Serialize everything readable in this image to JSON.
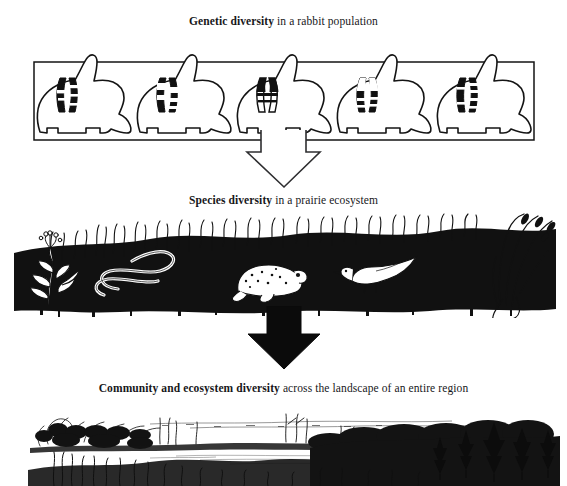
{
  "figure": {
    "title_implicit": "Levels of biodiversity",
    "background_color": "#ffffff",
    "ink_color": "#111111",
    "width": 567,
    "height": 486
  },
  "levels": [
    {
      "id": "genetic",
      "caption_lead": "Genetic diversity",
      "caption_rest": " in a rabbit population",
      "illustration": "boxed row of five rabbit silhouettes, each containing a differently banded chromosome pair",
      "organism": "rabbit",
      "organism_count": 5,
      "chromosome_pairs": [
        {
          "index": 1,
          "pattern": "dark left arm with pale mid-bands, speckled right arm"
        },
        {
          "index": 2,
          "pattern": "pale arms with heavy dark tips and central bands"
        },
        {
          "index": 3,
          "pattern": "solid black upper arms, open pale lower arms"
        },
        {
          "index": 4,
          "pattern": "pale upper arms, dark banded lower arms"
        },
        {
          "index": 5,
          "pattern": "dark left arm, striped banded right arm"
        }
      ]
    },
    {
      "id": "species",
      "caption_lead": "Species diversity",
      "caption_rest": " in a prairie ecosystem",
      "illustration": "dense black prairie grass band with several organisms",
      "organisms": [
        "flowering forb plant",
        "coiled garter snake",
        "toad",
        "bird",
        "tall seed-head grasses"
      ]
    },
    {
      "id": "community",
      "caption_lead": "Community and ecosystem diversity",
      "caption_rest": " across the landscape of an entire region",
      "illustration": "pen-and-ink panoramic landscape: open marsh and water in foreground, shrub line, conifer forest at right",
      "features": [
        "wetland marsh",
        "open water",
        "shrubs and willows",
        "spruce conifer stand",
        "distant horizon"
      ]
    }
  ],
  "arrows": [
    {
      "id": "arrow-genetic-to-species",
      "style": "outlined",
      "direction": "down"
    },
    {
      "id": "arrow-species-to-community",
      "style": "solid-black",
      "direction": "down"
    }
  ]
}
